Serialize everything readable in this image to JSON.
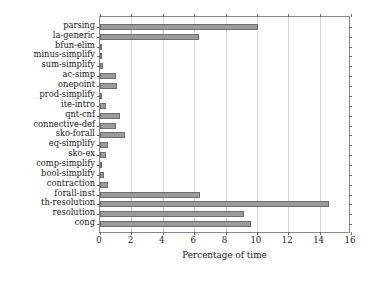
{
  "chart_data": {
    "type": "bar",
    "orientation": "horizontal",
    "title": "",
    "xlabel": "Percentage of time",
    "ylabel": "",
    "xlim": [
      0,
      16
    ],
    "ylim": [
      0,
      21
    ],
    "xticks": [
      0,
      2,
      4,
      6,
      8,
      10,
      12,
      14,
      16
    ],
    "xtick_labels": [
      "0",
      "2",
      "4",
      "6",
      "8",
      "10",
      "12",
      "14",
      "16"
    ],
    "grid": true,
    "grid_axis": "x",
    "legend": null,
    "bar_color": "#9b9b9b",
    "bar_edge_color": "#6d6d6d",
    "categories": [
      "parsing",
      "la-generic",
      "bfun-elim",
      "minus-simplify",
      "sum-simplify",
      "ac-simp",
      "onepoint",
      "prod-simplify",
      "ite-intro",
      "qnt-cnf",
      "connective-def",
      "sko-forall",
      "eq-simplify",
      "sko-ex",
      "comp-simplify",
      "bool-simplify",
      "contraction",
      "forall-inst",
      "th-resolution",
      "resolution",
      "cong"
    ],
    "values": [
      10.1,
      6.3,
      0.15,
      0.15,
      0.2,
      1.0,
      1.1,
      0.1,
      0.4,
      1.3,
      1.0,
      1.6,
      0.5,
      0.4,
      0.1,
      0.25,
      0.5,
      6.4,
      14.6,
      9.2,
      9.6
    ]
  }
}
